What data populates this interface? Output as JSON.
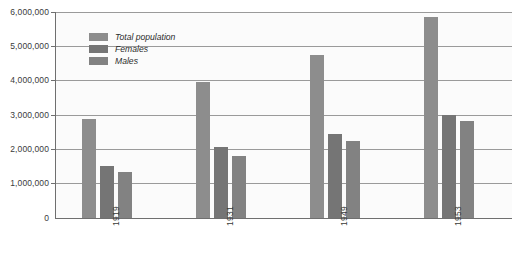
{
  "chart_data": {
    "type": "bar",
    "title": "",
    "subtitle": "",
    "xlabel": "",
    "ylabel": "",
    "categories": [
      "1919",
      "1931",
      "1949",
      "1953"
    ],
    "series": [
      {
        "name": "Total population",
        "color": "#8d8d8d",
        "values": [
          2880000,
          3960000,
          4760000,
          5850000
        ]
      },
      {
        "name": "Females",
        "color": "#757575",
        "values": [
          1520000,
          2070000,
          2440000,
          3000000
        ]
      },
      {
        "name": "Males",
        "color": "#828282",
        "values": [
          1350000,
          1810000,
          2240000,
          2820000
        ]
      }
    ],
    "ylim": [
      0,
      6000000
    ],
    "y_ticks": [
      0,
      1000000,
      2000000,
      3000000,
      4000000,
      5000000,
      6000000
    ],
    "y_tick_labels": [
      "0",
      "1,000,000",
      "2,000,000",
      "3,000,000",
      "4,000,000",
      "5,000,000",
      "6,000,000"
    ],
    "grid": true,
    "grid_axis": "y",
    "legend_position": "inside-top-left",
    "x_tick_label_rotation": -90
  },
  "legend": {
    "items": [
      {
        "label": "Total population",
        "swatch": "total"
      },
      {
        "label": "Females",
        "swatch": "females"
      },
      {
        "label": "Males",
        "swatch": "males"
      }
    ]
  },
  "axes": {
    "y_tick_labels": [
      "6,000,000",
      "5,000,000",
      "4,000,000",
      "3,000,000",
      "2,000,000",
      "1,000,000",
      "0"
    ],
    "x_tick_labels": [
      "1919",
      "1931",
      "1949",
      "1953"
    ]
  },
  "colors": {
    "total": "#8d8d8d",
    "females": "#757575",
    "males": "#828282",
    "axis": "#6f6f6f",
    "grid": "#9a9a9a",
    "plot_background": "#fbfbfb",
    "page_background": "#ffffff",
    "text": "#3a3a3a"
  }
}
